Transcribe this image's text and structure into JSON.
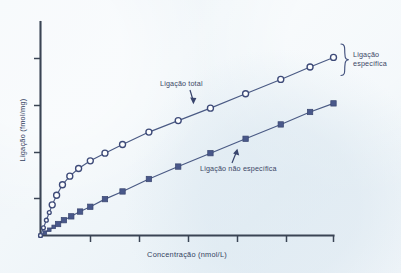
{
  "figure": {
    "background_color": "#eef4f8",
    "ink_color": "#3a4454",
    "series_color": "#49588a"
  },
  "axes": {
    "y_title": "Ligação  (fmol/mg)",
    "x_title": "Concentração (nmol/L)",
    "y_tick_count": 4,
    "x_tick_count": 6,
    "tick_labels_shown": "none"
  },
  "annotations": {
    "total_label": "Ligação total",
    "nonspecific_label": "Ligação não específica",
    "specific_label_line1": "Ligação",
    "specific_label_line2": "específica",
    "specific_label": "Ligação específica"
  },
  "chart_data": {
    "type": "line",
    "title": "",
    "xlabel": "Concentração (nmol/L)",
    "ylabel": "Ligação  (fmol/mg)",
    "xlim": [
      0,
      100
    ],
    "ylim": [
      0,
      100
    ],
    "grid": false,
    "legend": "inline-annotations",
    "tick_labels": {
      "x": [],
      "y": []
    },
    "series": [
      {
        "name": "Ligação total",
        "marker": "open-circle",
        "color": "#3d4a78",
        "x": [
          0.0,
          1.0,
          2.0,
          3.0,
          4.0,
          5.5,
          7.5,
          10.0,
          13.0,
          17.0,
          22.0,
          28.0,
          37.0,
          47.0,
          58.0,
          70.0,
          82.0,
          92.0,
          100.0
        ],
        "y": [
          0.0,
          4.0,
          8.0,
          12.0,
          16.0,
          21.0,
          26.5,
          31.0,
          35.0,
          39.0,
          43.0,
          47.5,
          54.0,
          60.0,
          66.5,
          74.0,
          81.5,
          88.0,
          93.0
        ]
      },
      {
        "name": "Ligação não específica",
        "marker": "filled-square",
        "color": "#49588a",
        "x": [
          0.0,
          1.5,
          3.0,
          4.5,
          6.0,
          8.0,
          10.5,
          13.5,
          17.0,
          22.0,
          28.0,
          37.0,
          47.0,
          58.0,
          70.0,
          82.0,
          92.0,
          100.0
        ],
        "y": [
          0.0,
          1.5,
          3.0,
          4.5,
          6.0,
          8.0,
          10.0,
          12.5,
          15.0,
          19.0,
          23.0,
          29.5,
          36.0,
          43.0,
          50.5,
          58.0,
          64.5,
          69.0
        ]
      }
    ],
    "bracket": {
      "label": "Ligação específica",
      "spans_series": [
        "Ligação total",
        "Ligação não específica"
      ],
      "at_x": 100
    }
  }
}
